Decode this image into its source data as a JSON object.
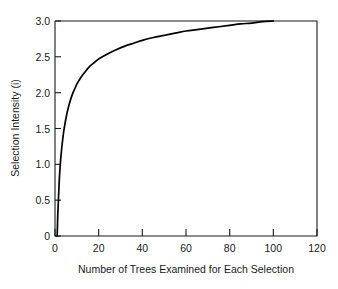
{
  "chart_data": {
    "type": "line",
    "title": "",
    "xlabel": "Number of Trees Examined for Each Selection",
    "ylabel": "Selection Intensity (i)",
    "xlim": [
      0,
      120
    ],
    "ylim": [
      0,
      3.0
    ],
    "grid": false,
    "legend": "none",
    "xticks": [
      0,
      20,
      40,
      60,
      80,
      100,
      120
    ],
    "xtick_labels": [
      "0",
      "20",
      "40",
      "60",
      "80",
      "100",
      "120"
    ],
    "yticks": [
      0,
      0.5,
      1.0,
      1.5,
      2.0,
      2.5,
      3.0
    ],
    "ytick_labels": [
      "0",
      "0.5",
      "1.0",
      "1.5",
      "2.0",
      "2.5",
      "3.0"
    ],
    "series": [
      {
        "name": "Selection intensity",
        "x": [
          1,
          1.3,
          1.7,
          2,
          2.5,
          3,
          3.5,
          4,
          5,
          6,
          7,
          8,
          9,
          10,
          12,
          14,
          16,
          18,
          20,
          24,
          28,
          32,
          36,
          40,
          45,
          50,
          55,
          60,
          65,
          70,
          75,
          80,
          85,
          90,
          95,
          100
        ],
        "y": [
          0.0,
          0.32,
          0.6,
          0.8,
          1.03,
          1.2,
          1.34,
          1.46,
          1.64,
          1.78,
          1.89,
          1.98,
          2.05,
          2.12,
          2.22,
          2.3,
          2.37,
          2.42,
          2.47,
          2.54,
          2.6,
          2.65,
          2.69,
          2.73,
          2.77,
          2.8,
          2.83,
          2.86,
          2.88,
          2.9,
          2.92,
          2.94,
          2.96,
          2.97,
          2.99,
          3.0
        ]
      }
    ],
    "curve_note": "Selection intensity rises steeply from 0 at n=1, reaching 1.0 near n=3, 2.0 near n=12, 2.5 near n=40, and plateaus at about 2.68 at n=100."
  },
  "axis": {
    "x_title": "Number of Trees Examined for Each Selection",
    "y_title": "Selection Intensity (i)"
  }
}
